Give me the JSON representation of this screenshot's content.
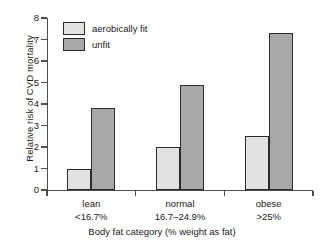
{
  "chart_data": {
    "type": "bar",
    "title": "",
    "subtitle": "",
    "xlabel": "Body fat category (% weight as fat)",
    "ylabel": "Relative risk of CVD mortality",
    "categories": [
      "lean",
      "normal",
      "obese"
    ],
    "category_sublabels": [
      "<16.7%",
      "16.7–24.9%",
      ">25%"
    ],
    "series": [
      {
        "name": "aerobically fit",
        "values": [
          1.0,
          2.0,
          2.5
        ],
        "color": "#e2e2e2"
      },
      {
        "name": "unfit",
        "values": [
          3.8,
          4.9,
          7.3
        ],
        "color": "#a8a8a8"
      }
    ],
    "ylim": [
      0,
      8
    ],
    "ytick_labels": [
      "8",
      "7",
      "6",
      "5",
      "4",
      "3",
      "2",
      "1",
      "0"
    ],
    "ytick_values": [
      8,
      7,
      6,
      5,
      4,
      3,
      2,
      1,
      0
    ],
    "ytick_step": 1,
    "grid": false,
    "legend_position": "top-left-inside",
    "bar_edge_color": "#2b2b2b",
    "axis_color": "#4d4d4d"
  },
  "legend": {
    "entries": [
      {
        "label": "aerobically fit"
      },
      {
        "label": "unfit"
      }
    ]
  },
  "axes": {
    "y_title": "Relative risk of CVD mortality",
    "x_title": "Body fat category (% weight as fat)"
  }
}
